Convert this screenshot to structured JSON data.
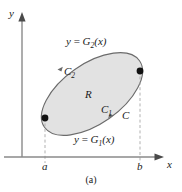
{
  "figure": {
    "caption": "(a)",
    "axes": {
      "y_axis_label": "y",
      "x_axis_label": "x",
      "x_ticks": [
        {
          "label": "a",
          "x": 45
        },
        {
          "label": "b",
          "x": 140
        }
      ]
    },
    "labels": {
      "upper_curve": {
        "lhs": "y",
        "eq": "=",
        "fn": "G",
        "sub": "2",
        "arg": "(x)"
      },
      "lower_curve": {
        "lhs": "y",
        "eq": "=",
        "fn": "G",
        "sub": "1",
        "arg": "(x)"
      },
      "upper_arc": {
        "fn": "C",
        "sub": "2"
      },
      "lower_arc": {
        "fn": "C",
        "sub": "1"
      },
      "region": "R",
      "boundary_curve": "C"
    },
    "colors": {
      "region_fill": "#e2e2e2",
      "curve_stroke": "#6b6b6b",
      "axis_stroke": "#8a8a8a",
      "dashed_stroke": "#a8a8a8",
      "marker_fill": "#111111",
      "text": "#1a1a1a"
    },
    "geometry": {
      "ellipse_center_x": 92,
      "ellipse_center_y": 94,
      "ellipse_rx": 58,
      "ellipse_ry": 30,
      "ellipse_rotation_deg": -35,
      "marker_left": {
        "x": 45,
        "y": 118
      },
      "marker_right": {
        "x": 140,
        "y": 71
      },
      "x_axis_y": 157,
      "y_axis_x": 22
    }
  }
}
